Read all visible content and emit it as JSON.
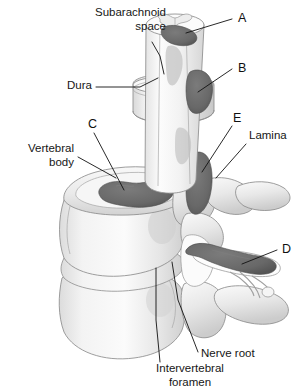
{
  "figure": {
    "title_text": "",
    "background_color": "#ffffff",
    "bone_fill": "#ededed",
    "bone_shadow": "#c9c9c9",
    "lesion_fill": "#6c6c6c",
    "lesion_fill_dark": "#5a5a5a",
    "lesion_fill_light": "#a9a9a9",
    "cord_fill": "#f5f5f5",
    "outline_color": "#8d8d8d",
    "leader_color": "#111111",
    "text_color": "#161616"
  },
  "labels": {
    "subarachnoid_space": {
      "line1": "Subarachnoid",
      "line2": "space",
      "x": 166,
      "y": 16,
      "anchor": "end"
    },
    "dura": {
      "text": "Dura",
      "x": 92,
      "y": 89,
      "anchor": "end"
    },
    "vertebral_body": {
      "line1": "Vertebral",
      "line2": "body",
      "x": 74,
      "y": 152,
      "anchor": "end"
    },
    "lamina": {
      "text": "Lamina",
      "x": 249,
      "y": 139,
      "anchor": "start"
    },
    "nerve_root": {
      "text": "Nerve root",
      "x": 201,
      "y": 357,
      "anchor": "start"
    },
    "intervertebral_foramen": {
      "line1": "Intervertebral",
      "line2": "foramen",
      "x": 190,
      "y": 372,
      "anchor": "middle"
    }
  },
  "lesion_markers": [
    {
      "id": "A",
      "letter": "A",
      "x": 238,
      "y": 22,
      "leader": "M232,18 L170,40"
    },
    {
      "id": "B",
      "letter": "B",
      "x": 238,
      "y": 72,
      "leader": "M232,69 L196,90"
    },
    {
      "id": "C",
      "letter": "C",
      "x": 90,
      "y": 128,
      "leader": "M94,132 L126,192"
    },
    {
      "id": "D",
      "letter": "D",
      "x": 282,
      "y": 253,
      "leader": "M278,250 L242,265"
    },
    {
      "id": "E",
      "letter": "E",
      "x": 235,
      "y": 122,
      "leader": "M232,126 L206,172"
    }
  ],
  "anatomy_parts": [
    {
      "name": "spinal-cord",
      "label": "spinal cord"
    },
    {
      "name": "gray-matter",
      "label": "gray matter butterfly"
    },
    {
      "name": "dura-sheath",
      "label": "dura mater sheath"
    },
    {
      "name": "vertebral-body-upper",
      "label": "upper vertebral body"
    },
    {
      "name": "vertebral-body-lower",
      "label": "lower vertebral body"
    },
    {
      "name": "intervertebral-disc",
      "label": "intervertebral disc"
    },
    {
      "name": "lamina",
      "label": "lamina"
    },
    {
      "name": "transverse-process",
      "label": "transverse process"
    },
    {
      "name": "pedicle",
      "label": "pedicle"
    },
    {
      "name": "nerve-root",
      "label": "nerve root"
    },
    {
      "name": "intervertebral-foramen",
      "label": "intervertebral foramen"
    }
  ]
}
